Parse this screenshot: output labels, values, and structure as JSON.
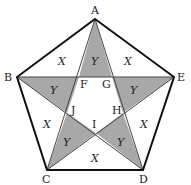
{
  "diagram": {
    "colors": {
      "shade": "#a8a8a8",
      "stroke": "#111111",
      "thin_stroke": "#444444",
      "background": "#ffffff"
    },
    "vertices": {
      "A": {
        "label": "A",
        "x": 95,
        "y": 19
      },
      "B": {
        "label": "B",
        "x": 17,
        "y": 77
      },
      "C": {
        "label": "C",
        "x": 47,
        "y": 170
      },
      "D": {
        "label": "D",
        "x": 143,
        "y": 170
      },
      "E": {
        "label": "E",
        "x": 174,
        "y": 77
      }
    },
    "inner_points": {
      "F": {
        "label": "F",
        "x": 79,
        "y": 77
      },
      "G": {
        "label": "G",
        "x": 112,
        "y": 77
      },
      "H": {
        "label": "H",
        "x": 123,
        "y": 113
      },
      "I": {
        "label": "I",
        "x": 96,
        "y": 133
      },
      "J": {
        "label": "J",
        "x": 67,
        "y": 113
      }
    },
    "region_labels": {
      "x_top_left": "X",
      "x_top_right": "X",
      "x_left": "X",
      "x_right": "X",
      "x_bottom": "X",
      "y_top": "Y",
      "y_left": "Y",
      "y_right": "Y",
      "y_bottom_left": "Y",
      "y_bottom_right": "Y"
    }
  }
}
